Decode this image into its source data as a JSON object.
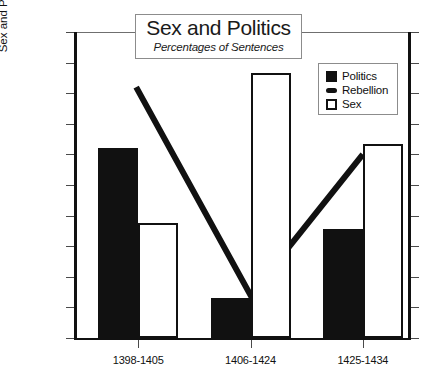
{
  "chart_data": {
    "type": "bar",
    "title": "Sex and Politics",
    "subtitle": "Percentages of Sentences",
    "xlabel": "",
    "ylabel_line1": "Percentages of Sentences",
    "ylabel_line2": "Sex and Political Crimes",
    "categories": [
      "1398-1405",
      "1406-1424",
      "1425-1434"
    ],
    "ylim": [
      0,
      100
    ],
    "yticks": [
      0,
      10,
      20,
      30,
      40,
      50,
      60,
      70,
      80,
      90,
      100
    ],
    "grid": false,
    "legend_position": "top-right",
    "series": [
      {
        "name": "Politics",
        "type": "bar",
        "style": "filled",
        "color": "#111111",
        "values": [
          62,
          13,
          35.5
        ]
      },
      {
        "name": "Rebellion",
        "type": "line",
        "style": "thick-line",
        "color": "#111111",
        "values": [
          82,
          14,
          60
        ]
      },
      {
        "name": "Sex",
        "type": "bar",
        "style": "open",
        "color": "#ffffff",
        "values": [
          37.7,
          86.5,
          63.5
        ]
      }
    ]
  },
  "legend": {
    "entries": [
      {
        "label": "Politics",
        "swatch": "filled-square-icon"
      },
      {
        "label": "Rebellion",
        "swatch": "thick-line-icon"
      },
      {
        "label": "Sex",
        "swatch": "open-square-icon"
      }
    ]
  },
  "axis": {
    "ytick_labels": [
      "100",
      "90",
      "80",
      "70",
      "60",
      "50",
      "40",
      "30",
      "20",
      "10",
      "0"
    ]
  }
}
